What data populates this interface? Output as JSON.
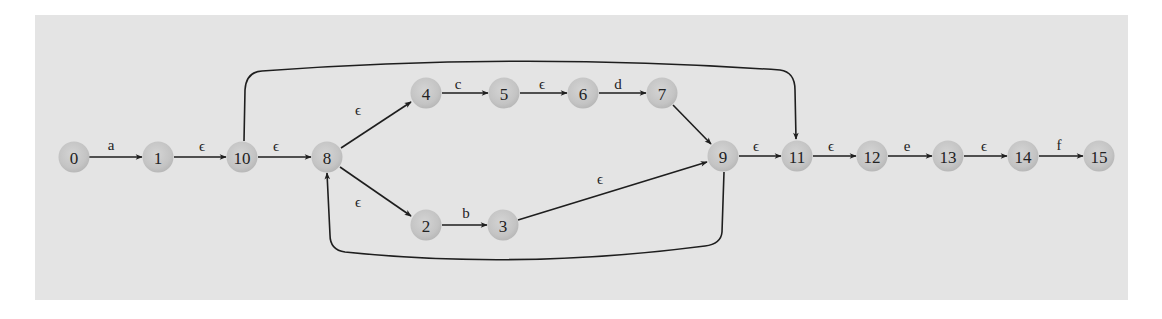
{
  "diagram": {
    "type": "NFA state transition diagram (Thompson construction)",
    "colors": {
      "background": "#e4e4e4",
      "node_fill": "#c8c8c8",
      "edge": "#1e1e1e",
      "text": "#222222"
    },
    "nodes": [
      {
        "id": "0",
        "label": "0",
        "x": 74,
        "y": 157
      },
      {
        "id": "1",
        "label": "1",
        "x": 158,
        "y": 157
      },
      {
        "id": "10",
        "label": "10",
        "x": 242,
        "y": 157
      },
      {
        "id": "8",
        "label": "8",
        "x": 327,
        "y": 157
      },
      {
        "id": "4",
        "label": "4",
        "x": 426,
        "y": 93
      },
      {
        "id": "5",
        "label": "5",
        "x": 504,
        "y": 93
      },
      {
        "id": "6",
        "label": "6",
        "x": 583,
        "y": 93
      },
      {
        "id": "7",
        "label": "7",
        "x": 662,
        "y": 93
      },
      {
        "id": "2",
        "label": "2",
        "x": 426,
        "y": 225
      },
      {
        "id": "3",
        "label": "3",
        "x": 503,
        "y": 225
      },
      {
        "id": "9",
        "label": "9",
        "x": 723,
        "y": 156
      },
      {
        "id": "11",
        "label": "11",
        "x": 797,
        "y": 156
      },
      {
        "id": "12",
        "label": "12",
        "x": 872,
        "y": 156
      },
      {
        "id": "13",
        "label": "13",
        "x": 948,
        "y": 156
      },
      {
        "id": "14",
        "label": "14",
        "x": 1023,
        "y": 156
      },
      {
        "id": "15",
        "label": "15",
        "x": 1099,
        "y": 156
      }
    ],
    "edges": [
      {
        "from": "0",
        "to": "1",
        "label": "a",
        "lx": 111,
        "ly": 145
      },
      {
        "from": "1",
        "to": "10",
        "label": "ϵ",
        "lx": 202,
        "ly": 146
      },
      {
        "from": "10",
        "to": "8",
        "label": "ϵ",
        "lx": 276,
        "ly": 146
      },
      {
        "from": "8",
        "to": "4",
        "label": "ϵ",
        "lx": 358,
        "ly": 110
      },
      {
        "from": "4",
        "to": "5",
        "label": "c",
        "lx": 458,
        "ly": 84
      },
      {
        "from": "5",
        "to": "6",
        "label": "ϵ",
        "lx": 542,
        "ly": 84
      },
      {
        "from": "6",
        "to": "7",
        "label": "d",
        "lx": 618,
        "ly": 84
      },
      {
        "from": "7",
        "to": "9",
        "label": "",
        "lx": 0,
        "ly": 0
      },
      {
        "from": "8",
        "to": "2",
        "label": "ϵ",
        "lx": 358,
        "ly": 202
      },
      {
        "from": "2",
        "to": "3",
        "label": "b",
        "lx": 466,
        "ly": 213
      },
      {
        "from": "3",
        "to": "9",
        "label": "ϵ",
        "lx": 600,
        "ly": 179
      },
      {
        "from": "9",
        "to": "11",
        "label": "ϵ",
        "lx": 756,
        "ly": 146
      },
      {
        "from": "9",
        "to": "8",
        "label": "",
        "lx": 0,
        "ly": 0
      },
      {
        "from": "10",
        "to": "11",
        "label": "",
        "lx": 0,
        "ly": 0
      },
      {
        "from": "11",
        "to": "12",
        "label": "ϵ",
        "lx": 831,
        "ly": 146
      },
      {
        "from": "12",
        "to": "13",
        "label": "e",
        "lx": 907,
        "ly": 146
      },
      {
        "from": "13",
        "to": "14",
        "label": "ϵ",
        "lx": 984,
        "ly": 146
      },
      {
        "from": "14",
        "to": "15",
        "label": "f",
        "lx": 1059,
        "ly": 145
      }
    ]
  }
}
